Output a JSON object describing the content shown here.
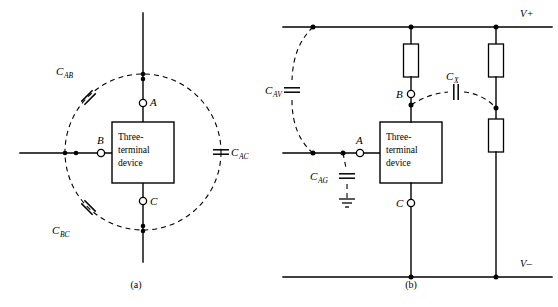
{
  "figure": {
    "background_color": "#ffffff",
    "line_color": "#000000"
  },
  "panel_a": {
    "caption": "(a)",
    "device_box": {
      "line1": "Three-",
      "line2": "terminal",
      "line3": "device"
    },
    "terminals": [
      {
        "name": "terminal-a",
        "label": "A",
        "position": "top"
      },
      {
        "name": "terminal-b",
        "label": "B",
        "position": "left"
      },
      {
        "name": "terminal-c",
        "label": "C",
        "position": "bottom"
      }
    ],
    "capacitors": [
      {
        "name": "capacitor-cab",
        "base": "C",
        "sub": "AB",
        "label": "C_AB",
        "orientation": "diagonal-upper-left"
      },
      {
        "name": "capacitor-cac",
        "base": "C",
        "sub": "AC",
        "label": "C_AC",
        "orientation": "vertical-right"
      },
      {
        "name": "capacitor-cbc",
        "base": "C",
        "sub": "BC",
        "label": "C_BC",
        "orientation": "diagonal-lower-left"
      }
    ]
  },
  "panel_b": {
    "caption": "(b)",
    "device_box": {
      "line1": "Three-",
      "line2": "terminal",
      "line3": "device"
    },
    "rails": [
      {
        "name": "rail-v-plus",
        "label": "V+",
        "position": "top"
      },
      {
        "name": "rail-v-minus",
        "label": "V–",
        "position": "bottom"
      }
    ],
    "terminals": [
      {
        "name": "terminal-a",
        "label": "A",
        "position": "left"
      },
      {
        "name": "terminal-b",
        "label": "B",
        "position": "top"
      },
      {
        "name": "terminal-c",
        "label": "C",
        "position": "bottom"
      }
    ],
    "capacitors": [
      {
        "name": "capacitor-cav",
        "base": "C",
        "sub": "AV",
        "label": "C_AV",
        "orientation": "vertical"
      },
      {
        "name": "capacitor-cag",
        "base": "C",
        "sub": "AG",
        "label": "C_AG",
        "orientation": "vertical"
      },
      {
        "name": "capacitor-cx",
        "base": "C",
        "sub": "X",
        "label": "C_X",
        "orientation": "horizontal"
      }
    ],
    "resistors": [
      {
        "name": "resistor-b-pullup"
      },
      {
        "name": "resistor-right-upper"
      },
      {
        "name": "resistor-right-lower"
      }
    ],
    "ground": {
      "name": "ground-symbol",
      "label": ""
    }
  }
}
